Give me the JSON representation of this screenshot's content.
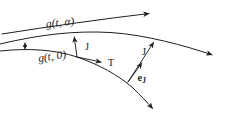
{
  "diagram": {
    "colors": {
      "ink": "#1f1f1f",
      "background": "#ffffff"
    },
    "labels": {
      "g_alpha": "g(t, α)",
      "g_zero": "g(t, 0)",
      "J_left": "J",
      "T": "T",
      "J_right": "J",
      "e_base": "e",
      "e_sub": "J"
    }
  }
}
